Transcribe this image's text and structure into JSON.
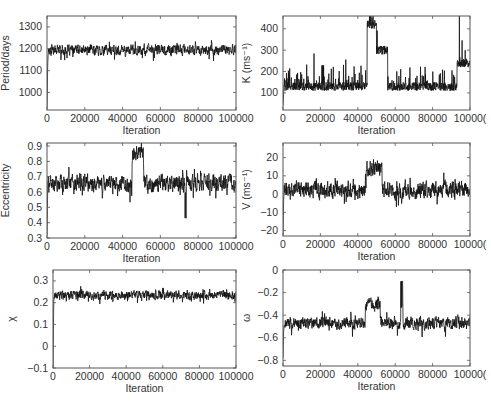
{
  "figure": {
    "layout": "3 rows x 2 columns of MCMC trace plots",
    "line_color": "#111111",
    "frame_color": "#555555",
    "background": "#ffffff"
  },
  "chart_data": [
    {
      "id": "period",
      "type": "line",
      "title": "",
      "xlabel": "Iteration",
      "ylabel": "Period/days",
      "xlim": [
        0,
        100000
      ],
      "ylim": [
        920,
        1350
      ],
      "xticks": [
        0,
        20000,
        40000,
        60000,
        80000,
        100000
      ],
      "xtick_labels": [
        "0",
        "20000",
        "40000",
        "60000",
        "80000",
        "100000"
      ],
      "yticks": [
        1000,
        1100,
        1200,
        1300
      ],
      "ytick_labels": [
        "1000",
        "1100",
        "1200",
        "1300"
      ],
      "grid": false,
      "trace": {
        "start": 930,
        "burnin_end": 1160,
        "mean": 1195,
        "spread": 35,
        "max_spike": 1340,
        "min_dip": 1110
      },
      "features": [
        {
          "x_range": [
            30000,
            36000
          ],
          "note": "spikes to ~1330-1340"
        }
      ]
    },
    {
      "id": "K",
      "type": "line",
      "title": "",
      "xlabel": "Iteration",
      "ylabel": "K (ms⁻¹)",
      "xlim": [
        0,
        100000
      ],
      "ylim": [
        20,
        460
      ],
      "xticks": [
        0,
        20000,
        40000,
        60000,
        80000,
        100000
      ],
      "xtick_labels": [
        "0",
        "20000",
        "40000",
        "60000",
        "80000",
        "10000("
      ],
      "yticks": [
        100,
        200,
        300,
        400
      ],
      "ytick_labels": [
        "100",
        "200",
        "300",
        "400"
      ],
      "grid": false,
      "trace": {
        "start": 40,
        "baseline": 110,
        "spread": 40,
        "max_spike": 450
      },
      "features": [
        {
          "x_range": [
            45000,
            50000
          ],
          "level": 400,
          "note": "excursion to 350-450"
        },
        {
          "x_range": [
            50000,
            56000
          ],
          "level": 280,
          "note": "decay"
        },
        {
          "x_range": [
            93000,
            100000
          ],
          "level": 220,
          "note": "spikes up to ~350"
        }
      ]
    },
    {
      "id": "eccentricity",
      "type": "line",
      "title": "",
      "xlabel": "Iteration",
      "ylabel": "Eccentricity",
      "xlim": [
        0,
        100000
      ],
      "ylim": [
        0.3,
        0.92
      ],
      "xticks": [
        0,
        20000,
        40000,
        60000,
        80000,
        100000
      ],
      "xtick_labels": [
        "0",
        "20000",
        "40000",
        "60000",
        "80000",
        "100000"
      ],
      "yticks": [
        0.3,
        0.4,
        0.5,
        0.6,
        0.7,
        0.8,
        0.9
      ],
      "ytick_labels": [
        "0.3",
        "0.4",
        "0.5",
        "0.6",
        "0.7",
        "0.8",
        "0.9"
      ],
      "grid": false,
      "trace": {
        "start": 0.32,
        "mean": 0.66,
        "spread": 0.08,
        "max_spike": 0.9,
        "min_dip": 0.43
      },
      "features": [
        {
          "x_range": [
            45000,
            51000
          ],
          "level": 0.86,
          "note": "plateau near 0.85-0.9"
        },
        {
          "x_range": [
            73000,
            74000
          ],
          "level": 0.43,
          "note": "single dip"
        }
      ]
    },
    {
      "id": "V",
      "type": "line",
      "title": "",
      "xlabel": "Iteration",
      "ylabel": "V (ms⁻¹)",
      "xlim": [
        0,
        100000
      ],
      "ylim": [
        -23,
        28
      ],
      "xticks": [
        0,
        20000,
        40000,
        60000,
        80000,
        100000
      ],
      "xtick_labels": [
        "0",
        "20000",
        "40000",
        "60000",
        "80000",
        "10000("
      ],
      "yticks": [
        -20,
        -10,
        0,
        10,
        20
      ],
      "ytick_labels": [
        "−20",
        "−10",
        "0",
        "10",
        "20"
      ],
      "grid": false,
      "trace": {
        "start": -22,
        "mean": 2,
        "spread": 7,
        "max_spike": 27,
        "min_dip": -16
      },
      "features": [
        {
          "x_range": [
            44000,
            53000
          ],
          "level": 14,
          "note": "raised level, peak ~27"
        }
      ]
    },
    {
      "id": "chi",
      "type": "line",
      "title": "",
      "xlabel": "Iteration",
      "ylabel": "χ",
      "xlim": [
        0,
        100000
      ],
      "ylim": [
        -0.1,
        0.35
      ],
      "xticks": [
        0,
        20000,
        40000,
        60000,
        80000,
        100000
      ],
      "xtick_labels": [
        "0",
        "20000",
        "40000",
        "60000",
        "80000",
        "100000"
      ],
      "yticks": [
        -0.1,
        0,
        0.1,
        0.2,
        0.3
      ],
      "ytick_labels": [
        "−0.1",
        "0",
        "0.1",
        "0.2",
        "0.3"
      ],
      "grid": false,
      "trace": {
        "start": -0.1,
        "mean": 0.235,
        "spread": 0.03,
        "max_spike": 0.34,
        "min_dip": 0.13
      }
    },
    {
      "id": "omega",
      "type": "line",
      "title": "",
      "xlabel": "Iteration",
      "ylabel": "ω",
      "xlim": [
        0,
        100000
      ],
      "ylim": [
        -0.85,
        0
      ],
      "xticks": [
        0,
        20000,
        40000,
        60000,
        80000,
        100000
      ],
      "xtick_labels": [
        "0",
        "20000",
        "40000",
        "60000",
        "80000",
        "10000("
      ],
      "yticks": [
        -0.8,
        -0.6,
        -0.4,
        -0.2,
        0
      ],
      "ytick_labels": [
        "−0.8",
        "−0.6",
        "−0.4",
        "−0.2",
        "0"
      ],
      "grid": false,
      "trace": {
        "start": -0.78,
        "mean": -0.47,
        "spread": 0.08,
        "max_spike": -0.1,
        "min_dip": -0.8
      },
      "features": [
        {
          "x_range": [
            44000,
            52000
          ],
          "level": -0.3,
          "note": "raised hump near -0.25"
        },
        {
          "x_range": [
            63000,
            64000
          ],
          "level": -0.1,
          "note": "single spike"
        }
      ]
    }
  ]
}
